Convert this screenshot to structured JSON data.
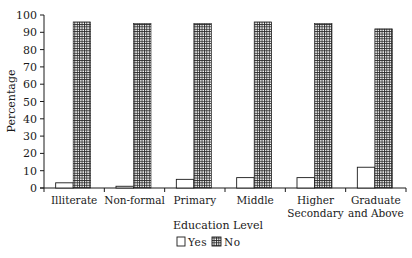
{
  "chart_data": {
    "type": "bar",
    "title": "",
    "xlabel": "Education Level",
    "ylabel": "Percentage",
    "ylim": [
      0,
      100
    ],
    "yticks": [
      0,
      10,
      20,
      30,
      40,
      50,
      60,
      70,
      80,
      90,
      100
    ],
    "grid": false,
    "legend_position": "bottom-center",
    "categories": [
      "Illiterate",
      "Non-formal",
      "Primary",
      "Middle",
      "Higher Secondary",
      "Graduate and Above"
    ],
    "category_lines": [
      [
        "Illiterate"
      ],
      [
        "Non-formal"
      ],
      [
        "Primary"
      ],
      [
        "Middle"
      ],
      [
        "Higher",
        "Secondary"
      ],
      [
        "Graduate",
        "and Above"
      ]
    ],
    "series": [
      {
        "name": "Yes",
        "fill": "white",
        "values": [
          3,
          1,
          5,
          6,
          6,
          12
        ]
      },
      {
        "name": "No",
        "fill": "crosshatch",
        "values": [
          96,
          95,
          95,
          96,
          95,
          92
        ]
      }
    ]
  },
  "legend": {
    "yes_label": "Yes",
    "no_label": "No"
  },
  "colors": {
    "ink": "#1a1a1a",
    "background": "#ffffff",
    "hatch_dark": "#2a2a2a",
    "hatch_light": "#ffffff"
  }
}
